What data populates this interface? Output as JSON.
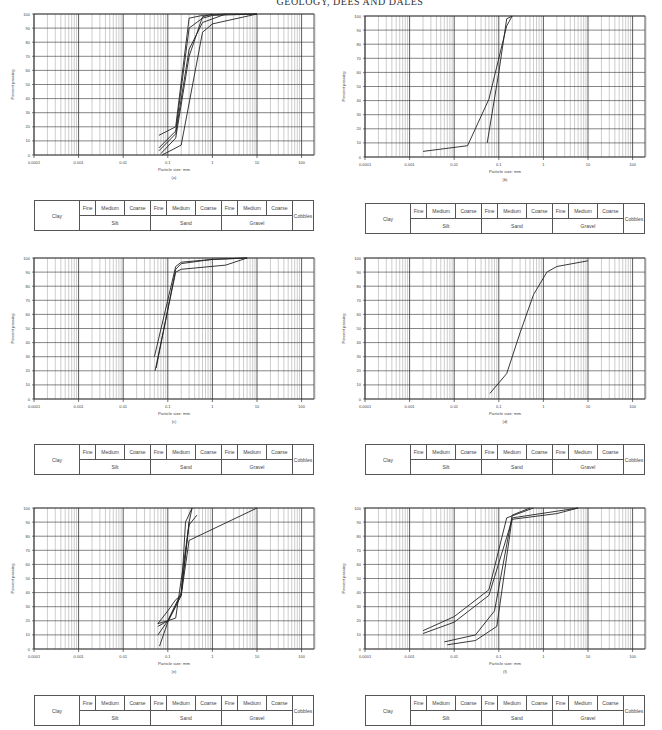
{
  "page": {
    "header": "GEOLOGY, DEES AND DALES"
  },
  "classification_table": {
    "clay": "Clay",
    "subdivisions": [
      "Fine",
      "Medium",
      "Coarse"
    ],
    "groups": [
      "Silt",
      "Sand",
      "Gravel"
    ],
    "cobbles": "Cobbles"
  },
  "colors": {
    "grid": "#9a9a9a",
    "axis": "#333333",
    "curve": "#222222"
  },
  "chart_data": [
    {
      "id": "a",
      "caption": "(a)",
      "type": "line",
      "xlabel": "Particle size: mm",
      "ylabel": "Percent passing",
      "xscale": "log",
      "xlim": [
        0.0001,
        200
      ],
      "ylim": [
        0,
        100
      ],
      "xticks": [
        "0.0001",
        "0.001",
        "0.01",
        "0.1",
        "1",
        "10",
        "100"
      ],
      "yticks": [
        0,
        10,
        20,
        30,
        40,
        50,
        60,
        70,
        80,
        90,
        100
      ],
      "grid": true,
      "series": [
        {
          "name": "s1",
          "x": [
            0.063,
            0.15,
            0.3,
            0.6,
            2,
            10
          ],
          "y": [
            14,
            20,
            97,
            99,
            100,
            100
          ]
        },
        {
          "name": "s2",
          "x": [
            0.063,
            0.15,
            0.3,
            0.6,
            1,
            10
          ],
          "y": [
            5,
            17,
            90,
            97,
            99,
            100
          ]
        },
        {
          "name": "s3",
          "x": [
            0.063,
            0.15,
            0.3,
            0.6,
            2
          ],
          "y": [
            3,
            15,
            75,
            94,
            100
          ]
        },
        {
          "name": "s4",
          "x": [
            0.075,
            0.2,
            0.6,
            1,
            10
          ],
          "y": [
            0,
            7,
            87,
            93,
            100
          ]
        },
        {
          "name": "s5",
          "x": [
            0.07,
            0.15,
            0.3,
            0.6,
            1
          ],
          "y": [
            1,
            12,
            70,
            98,
            100
          ]
        }
      ]
    },
    {
      "id": "b",
      "caption": "(b)",
      "type": "line",
      "xlabel": "Particle size: mm",
      "ylabel": "Percent passing",
      "xscale": "log",
      "xlim": [
        0.0001,
        200
      ],
      "ylim": [
        0,
        100
      ],
      "xticks": [
        "0.0001",
        "0.001",
        "0.01",
        "0.1",
        "1",
        "10",
        "100"
      ],
      "yticks": [
        0,
        10,
        20,
        30,
        40,
        50,
        60,
        70,
        80,
        90,
        100
      ],
      "grid": true,
      "series": [
        {
          "name": "s1",
          "x": [
            0.002,
            0.02,
            0.06,
            0.15,
            0.2
          ],
          "y": [
            4,
            8,
            41,
            93,
            100
          ]
        },
        {
          "name": "s2",
          "x": [
            0.055,
            0.1,
            0.15,
            0.2
          ],
          "y": [
            10,
            60,
            98,
            100
          ]
        }
      ]
    },
    {
      "id": "c",
      "caption": "(c)",
      "type": "line",
      "xlabel": "Particle size: mm",
      "ylabel": "Percent passing",
      "xscale": "log",
      "xlim": [
        0.0001,
        200
      ],
      "ylim": [
        0,
        100
      ],
      "xticks": [
        "0.0001",
        "0.001",
        "0.01",
        "0.1",
        "1",
        "10",
        "100"
      ],
      "yticks": [
        0,
        10,
        20,
        30,
        40,
        50,
        60,
        70,
        80,
        90,
        100
      ],
      "grid": true,
      "series": [
        {
          "name": "s1",
          "x": [
            0.05,
            0.15,
            0.2,
            1,
            6
          ],
          "y": [
            30,
            94,
            97,
            99,
            100
          ]
        },
        {
          "name": "s2",
          "x": [
            0.052,
            0.15,
            0.2,
            2,
            6
          ],
          "y": [
            20,
            90,
            92,
            95,
            100
          ]
        },
        {
          "name": "s3",
          "x": [
            0.055,
            0.15,
            0.2,
            1,
            6
          ],
          "y": [
            22,
            92,
            96,
            99,
            100
          ]
        }
      ]
    },
    {
      "id": "d",
      "caption": "(d)",
      "type": "line",
      "xlabel": "Particle size: mm",
      "ylabel": "Percent passing",
      "xscale": "log",
      "xlim": [
        0.0001,
        200
      ],
      "ylim": [
        0,
        100
      ],
      "xticks": [
        "0.0001",
        "0.001",
        "0.01",
        "0.1",
        "1",
        "10",
        "100"
      ],
      "yticks": [
        0,
        10,
        20,
        30,
        40,
        50,
        60,
        70,
        80,
        90,
        100
      ],
      "grid": true,
      "series": [
        {
          "name": "s1",
          "x": [
            0.063,
            0.15,
            0.3,
            0.6,
            1.2,
            2,
            10
          ],
          "y": [
            4,
            18,
            47,
            74,
            90,
            94,
            98
          ]
        }
      ]
    },
    {
      "id": "e",
      "caption": "(e)",
      "type": "line",
      "xlabel": "Particle size: mm",
      "ylabel": "Percent passing",
      "xscale": "log",
      "xlim": [
        0.0001,
        200
      ],
      "ylim": [
        0,
        100
      ],
      "xticks": [
        "0.0001",
        "0.001",
        "0.01",
        "0.1",
        "1",
        "10",
        "100"
      ],
      "yticks": [
        0,
        10,
        20,
        30,
        40,
        50,
        60,
        70,
        80,
        90,
        100
      ],
      "grid": true,
      "series": [
        {
          "name": "s1",
          "x": [
            0.06,
            0.1,
            0.15,
            0.2,
            0.3,
            10
          ],
          "y": [
            18,
            27,
            35,
            38,
            77,
            100
          ]
        },
        {
          "name": "s2",
          "x": [
            0.06,
            0.1,
            0.15,
            0.3,
            0.45
          ],
          "y": [
            16,
            20,
            22,
            88,
            95
          ]
        },
        {
          "name": "s3",
          "x": [
            0.06,
            0.1,
            0.2,
            0.3,
            0.35
          ],
          "y": [
            10,
            20,
            38,
            90,
            100
          ]
        },
        {
          "name": "s4",
          "x": [
            0.065,
            0.1,
            0.2,
            0.25,
            0.35
          ],
          "y": [
            2,
            19,
            38,
            90,
            100
          ]
        },
        {
          "name": "s5",
          "x": [
            0.06,
            0.1,
            0.2,
            0.3
          ],
          "y": [
            18,
            20,
            40,
            90
          ]
        }
      ]
    },
    {
      "id": "f",
      "caption": "(f)",
      "type": "line",
      "xlabel": "Particle size: mm",
      "ylabel": "Percent passing",
      "xscale": "log",
      "xlim": [
        0.0001,
        200
      ],
      "ylim": [
        0,
        100
      ],
      "xticks": [
        "0.0001",
        "0.001",
        "0.01",
        "0.1",
        "1",
        "10",
        "100"
      ],
      "yticks": [
        0,
        10,
        20,
        30,
        40,
        50,
        60,
        70,
        80,
        90,
        100
      ],
      "grid": true,
      "series": [
        {
          "name": "s1",
          "x": [
            0.002,
            0.01,
            0.06,
            0.15,
            0.6
          ],
          "y": [
            13,
            23,
            42,
            93,
            100
          ]
        },
        {
          "name": "s2",
          "x": [
            0.002,
            0.01,
            0.06,
            0.2,
            2,
            6
          ],
          "y": [
            11,
            19,
            38,
            92,
            96,
            100
          ]
        },
        {
          "name": "s3",
          "x": [
            0.006,
            0.03,
            0.08,
            0.2,
            0.5
          ],
          "y": [
            5,
            10,
            27,
            95,
            100
          ]
        },
        {
          "name": "s4",
          "x": [
            0.007,
            0.03,
            0.09,
            0.2,
            6
          ],
          "y": [
            3,
            6,
            16,
            93,
            100
          ]
        }
      ]
    }
  ]
}
